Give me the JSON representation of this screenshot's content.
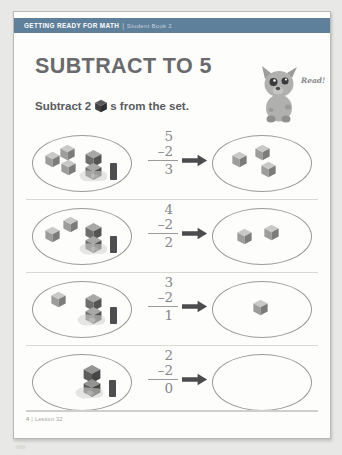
{
  "header": {
    "main_title": "GETTING READY FOR MATH",
    "separator": "|",
    "subtitle": "Student Book 2",
    "band_color": "#4a6f8e"
  },
  "title": "SUBTRACT TO 5",
  "instruction": {
    "before_cube": "Subtract 2",
    "after_cube": "s from the set.",
    "cube_icon": "cube-icon"
  },
  "mascot": {
    "name": "dog-mascot",
    "speech_label": "Read!"
  },
  "footer": {
    "page_number": "4",
    "separator": "|",
    "lesson_label": "Lesson 32"
  },
  "colors": {
    "title_grey": "#6a6a6d",
    "cube_top": "#c9c9c7",
    "cube_left": "#9d9d9b",
    "cube_right": "#7c7c7a",
    "arrow": "#4c4c4e",
    "oval_stroke": "#9a9a98"
  },
  "problems": [
    {
      "id": "problem-1",
      "minuend": "5",
      "operator": "–",
      "subtrahend": "2",
      "answer": "3",
      "start_cubes": 5,
      "result_cubes": 3,
      "removed_cubes": 2
    },
    {
      "id": "problem-2",
      "minuend": "4",
      "operator": "–",
      "subtrahend": "2",
      "answer": "2",
      "start_cubes": 4,
      "result_cubes": 2,
      "removed_cubes": 2
    },
    {
      "id": "problem-3",
      "minuend": "3",
      "operator": "–",
      "subtrahend": "2",
      "answer": "1",
      "start_cubes": 3,
      "result_cubes": 1,
      "removed_cubes": 2
    },
    {
      "id": "problem-4",
      "minuend": "2",
      "operator": "–",
      "subtrahend": "2",
      "answer": "0",
      "start_cubes": 2,
      "result_cubes": 0,
      "removed_cubes": 2
    }
  ]
}
